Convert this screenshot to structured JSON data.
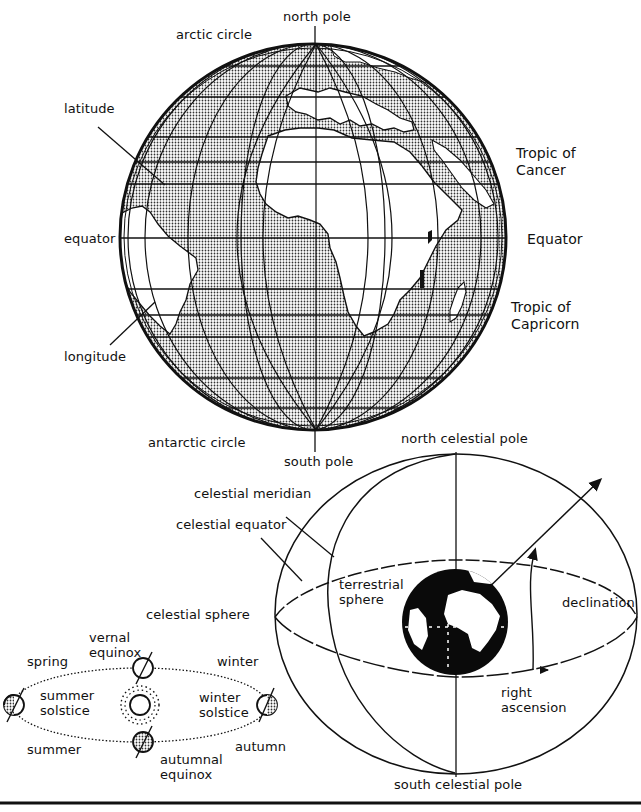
{
  "figure": {
    "type": "diagram",
    "colors": {
      "ink": "#111111",
      "land_fill": "#bdbdbd",
      "background": "#ffffff",
      "earth_dark": "#0a0a0a"
    }
  },
  "globe": {
    "labels": {
      "north_pole": "north pole",
      "arctic_circle": "arctic circle",
      "latitude": "latitude",
      "equator_left": "equator",
      "longitude": "longitude",
      "antarctic_circle": "antarctic circle",
      "south_pole": "south pole",
      "tropic_of_cancer": "Tropic of\nCancer",
      "equator_right": "Equator",
      "tropic_of_capricorn": "Tropic of\nCapricorn"
    }
  },
  "celestial": {
    "labels": {
      "north_celestial_pole": "north celestial pole",
      "celestial_meridian": "celestial meridian",
      "celestial_equator": "celestial equator",
      "terrestrial_sphere": "terrestrial\nsphere",
      "declination": "declination",
      "right_ascension": "right\nascension",
      "south_celestial_pole": "south celestial pole",
      "celestial_sphere": "celestial sphere"
    }
  },
  "orbit": {
    "labels": {
      "vernal_equinox": "vernal\nequinox",
      "spring": "spring",
      "winter": "winter",
      "summer_solstice": "summer\nsolstice",
      "winter_solstice": "winter\nsolstice",
      "summer": "summer",
      "autumn": "autumn",
      "autumnal_equinox": "autumnal\nequinox"
    }
  }
}
